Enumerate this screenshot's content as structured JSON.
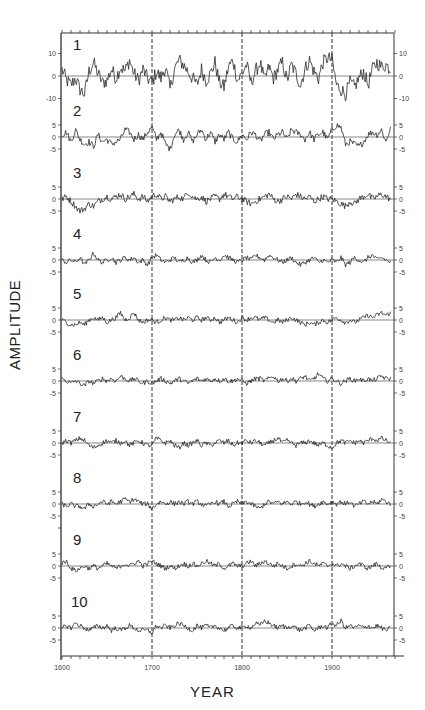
{
  "chart_data": {
    "type": "line",
    "title": "",
    "xlabel": "YEAR",
    "ylabel": "AMPLITUDE",
    "xlim": [
      1600,
      1965
    ],
    "x_ticks": [
      1600,
      1700,
      1800,
      1900
    ],
    "x_tick_labels": [
      "1600",
      "1700",
      "1800",
      "1900"
    ],
    "x_minor_tick_step": 10,
    "vertical_reference_lines": [
      1700,
      1800,
      1900
    ],
    "grid": false,
    "legend": null,
    "sample_step_years": 5,
    "x": [
      1600,
      1605,
      1610,
      1615,
      1620,
      1625,
      1630,
      1635,
      1640,
      1645,
      1650,
      1655,
      1660,
      1665,
      1670,
      1675,
      1680,
      1685,
      1690,
      1695,
      1700,
      1705,
      1710,
      1715,
      1720,
      1725,
      1730,
      1735,
      1740,
      1745,
      1750,
      1755,
      1760,
      1765,
      1770,
      1775,
      1780,
      1785,
      1790,
      1795,
      1800,
      1805,
      1810,
      1815,
      1820,
      1825,
      1830,
      1835,
      1840,
      1845,
      1850,
      1855,
      1860,
      1865,
      1870,
      1875,
      1880,
      1885,
      1890,
      1895,
      1900,
      1905,
      1910,
      1915,
      1920,
      1925,
      1930,
      1935,
      1940,
      1945,
      1950,
      1955,
      1960,
      1965
    ],
    "series": [
      {
        "name": "1",
        "y_ticks": [
          10,
          0,
          -10
        ],
        "ylim": [
          -15,
          15
        ],
        "values": [
          3,
          -2,
          -4,
          -1,
          -6,
          -8,
          2,
          6,
          1,
          -3,
          -2,
          3,
          -1,
          4,
          2,
          7,
          1,
          -2,
          3,
          -1,
          -3,
          2,
          -1,
          4,
          -6,
          3,
          7,
          5,
          2,
          -1,
          -4,
          3,
          -2,
          1,
          6,
          -3,
          -5,
          4,
          7,
          -2,
          1,
          5,
          -3,
          2,
          6,
          -2,
          4,
          -1,
          3,
          6,
          -2,
          5,
          1,
          -4,
          3,
          7,
          2,
          -1,
          6,
          8,
          7,
          -4,
          -6,
          -8,
          -3,
          -5,
          -1,
          2,
          -4,
          3,
          6,
          4,
          5,
          3
        ]
      },
      {
        "name": "2",
        "y_ticks": [
          5,
          0,
          -5
        ],
        "ylim": [
          -7,
          7
        ],
        "values": [
          1,
          2,
          -2,
          3,
          -1,
          -3,
          -2,
          -4,
          1,
          -2,
          -1,
          -3,
          -2,
          -1,
          3,
          2,
          -1,
          1,
          -1,
          2,
          4,
          -1,
          2,
          -3,
          -5,
          1,
          3,
          -1,
          2,
          -2,
          1,
          3,
          -1,
          2,
          -2,
          1,
          -1,
          2,
          -1,
          -2,
          1,
          -1,
          2,
          1,
          -2,
          1,
          2,
          -1,
          1,
          2,
          -1,
          3,
          2,
          1,
          -1,
          2,
          -1,
          1,
          2,
          -1,
          3,
          5,
          4,
          -3,
          -2,
          -3,
          -4,
          -2,
          1,
          2,
          1,
          3,
          -2,
          4
        ]
      },
      {
        "name": "3",
        "y_ticks": [
          5,
          0,
          -5
        ],
        "ylim": [
          -7,
          7
        ],
        "values": [
          0,
          1,
          -1,
          -3,
          -5,
          -4,
          -2,
          -3,
          -1,
          0,
          1,
          0,
          1,
          2,
          0,
          1,
          2,
          0,
          1,
          -1,
          1,
          2,
          0,
          1,
          -1,
          0,
          1,
          0,
          3,
          1,
          0,
          1,
          -1,
          0,
          1,
          0,
          2,
          1,
          0,
          1,
          0,
          -1,
          -2,
          -1,
          0,
          1,
          2,
          0,
          -1,
          0,
          1,
          0,
          2,
          1,
          0,
          1,
          -1,
          0,
          1,
          0,
          0,
          -1,
          -2,
          -3,
          -1,
          -2,
          0,
          1,
          2,
          0,
          1,
          2,
          1,
          0
        ]
      },
      {
        "name": "4",
        "y_ticks": [
          5,
          0,
          -5
        ],
        "ylim": [
          -7,
          7
        ],
        "values": [
          0,
          -1,
          0,
          -1,
          1,
          -2,
          0,
          3,
          0,
          -1,
          0,
          1,
          -1,
          0,
          1,
          0,
          1,
          -1,
          0,
          -2,
          1,
          2,
          0,
          -1,
          0,
          1,
          -1,
          0,
          1,
          -1,
          0,
          2,
          0,
          -1,
          1,
          0,
          2,
          1,
          0,
          -1,
          0,
          1,
          0,
          2,
          1,
          0,
          2,
          1,
          0,
          -1,
          0,
          1,
          -1,
          -2,
          -1,
          0,
          1,
          -1,
          0,
          -1,
          0,
          -1,
          1,
          -2,
          -1,
          1,
          0,
          -1,
          1,
          2,
          0,
          1,
          0,
          -1
        ]
      },
      {
        "name": "5",
        "y_ticks": [
          5,
          0,
          -5
        ],
        "ylim": [
          -7,
          7
        ],
        "values": [
          0,
          -1,
          -2,
          -2,
          -1,
          -2,
          0,
          1,
          0,
          1,
          -1,
          0,
          1,
          3,
          0,
          1,
          3,
          0,
          -1,
          0,
          0,
          -1,
          0,
          1,
          0,
          0,
          1,
          0,
          1,
          0,
          1,
          0,
          1,
          0,
          1,
          -1,
          0,
          1,
          0,
          -1,
          1,
          0,
          1,
          1,
          0,
          1,
          0,
          -1,
          0,
          -1,
          0,
          1,
          0,
          -1,
          -2,
          -1,
          -2,
          -1,
          0,
          -1,
          0,
          1,
          0,
          -1,
          0,
          -1,
          0,
          1,
          2,
          1,
          2,
          3,
          2,
          3
        ]
      },
      {
        "name": "6",
        "y_ticks": [
          5,
          0,
          -5
        ],
        "ylim": [
          -7,
          7
        ],
        "values": [
          1,
          0,
          -1,
          0,
          -1,
          -2,
          0,
          -1,
          0,
          1,
          0,
          1,
          0,
          2,
          1,
          0,
          1,
          0,
          -1,
          0,
          -1,
          0,
          1,
          0,
          -1,
          0,
          1,
          0,
          -1,
          0,
          1,
          0,
          1,
          0,
          1,
          0,
          1,
          0,
          0,
          1,
          0,
          -1,
          0,
          1,
          1,
          0,
          1,
          2,
          0,
          1,
          0,
          1,
          0,
          1,
          2,
          0,
          1,
          3,
          1,
          0,
          1,
          0,
          -1,
          0,
          1,
          0,
          1,
          0,
          1,
          0,
          1,
          2,
          1,
          1
        ]
      },
      {
        "name": "7",
        "y_ticks": [
          5,
          0,
          -5
        ],
        "ylim": [
          -7,
          7
        ],
        "values": [
          0,
          1,
          0,
          1,
          2,
          1,
          -1,
          -2,
          -1,
          0,
          1,
          0,
          1,
          0,
          1,
          -1,
          0,
          1,
          0,
          -1,
          -1,
          2,
          1,
          0,
          1,
          -1,
          -2,
          0,
          -1,
          0,
          1,
          -1,
          0,
          -1,
          0,
          1,
          0,
          1,
          -1,
          0,
          0,
          1,
          0,
          1,
          0,
          -1,
          0,
          1,
          2,
          0,
          1,
          0,
          -1,
          0,
          0,
          1,
          0,
          -1,
          0,
          -1,
          -2,
          0,
          1,
          0,
          1,
          0,
          1,
          0,
          1,
          2,
          1,
          2,
          1,
          0
        ]
      },
      {
        "name": "8",
        "y_ticks": [
          5,
          0,
          -5
        ],
        "ylim": [
          -7,
          7
        ],
        "values": [
          0,
          -1,
          0,
          -1,
          -1,
          -2,
          0,
          -1,
          0,
          1,
          0,
          1,
          0,
          1,
          2,
          1,
          2,
          1,
          0,
          0,
          -2,
          0,
          1,
          0,
          1,
          0,
          1,
          0,
          1,
          0,
          1,
          0,
          -1,
          0,
          1,
          0,
          1,
          -1,
          0,
          1,
          0,
          1,
          0,
          -1,
          -2,
          0,
          1,
          0,
          1,
          0,
          1,
          0,
          1,
          0,
          1,
          0,
          -1,
          0,
          1,
          0,
          1,
          0,
          1,
          0,
          1,
          -1,
          0,
          1,
          0,
          1,
          0,
          2,
          1,
          0
        ]
      },
      {
        "name": "9",
        "y_ticks": [
          5,
          0,
          -5
        ],
        "ylim": [
          -7,
          7
        ],
        "values": [
          1,
          2,
          -1,
          -2,
          -1,
          0,
          -1,
          0,
          -1,
          0,
          1,
          0,
          -1,
          0,
          1,
          0,
          1,
          2,
          0,
          1,
          2,
          1,
          0,
          -1,
          0,
          -1,
          0,
          1,
          0,
          1,
          0,
          1,
          2,
          1,
          0,
          1,
          -1,
          0,
          1,
          0,
          0,
          1,
          2,
          0,
          1,
          2,
          1,
          0,
          1,
          0,
          -1,
          0,
          1,
          0,
          1,
          2,
          1,
          0,
          1,
          0,
          1,
          0,
          1,
          0,
          -1,
          0,
          1,
          0,
          -1,
          0,
          1,
          -1,
          0,
          -1
        ]
      },
      {
        "name": "10",
        "y_ticks": [
          5,
          0,
          -5
        ],
        "ylim": [
          -7,
          7
        ],
        "values": [
          0,
          1,
          0,
          2,
          1,
          0,
          -1,
          0,
          1,
          0,
          1,
          -1,
          0,
          -1,
          0,
          1,
          0,
          -1,
          -1,
          -1,
          -2,
          1,
          0,
          1,
          0,
          1,
          2,
          1,
          0,
          -1,
          1,
          0,
          1,
          0,
          1,
          0,
          -1,
          0,
          1,
          0,
          0,
          1,
          0,
          2,
          1,
          3,
          2,
          1,
          0,
          1,
          0,
          1,
          0,
          -1,
          0,
          1,
          -1,
          0,
          1,
          0,
          2,
          1,
          3,
          0,
          1,
          0,
          1,
          0,
          1,
          0,
          1,
          0,
          -1,
          0
        ]
      }
    ]
  },
  "labels": {
    "ylabel": "AMPLITUDE",
    "xlabel": "YEAR"
  },
  "style": {
    "line_color": "#2a2a2a",
    "axis_color": "#333333",
    "background": "#ffffff"
  }
}
